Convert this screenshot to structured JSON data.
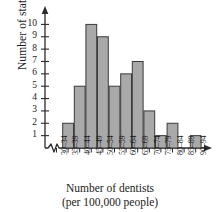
{
  "chart_data": {
    "type": "bar",
    "title": "",
    "xlabel": "Number of dentists",
    "xlabel_line2": "(per 100,000 people)",
    "ylabel": "Number of states",
    "categories": [
      "30–34",
      "35–39",
      "40–44",
      "45–49",
      "50–54",
      "55–59",
      "60–64",
      "65–69",
      "70–74",
      "75–79",
      "80–84",
      "85–89",
      "90–94"
    ],
    "values": [
      0,
      2,
      5,
      10,
      9,
      5,
      6,
      7,
      3,
      1,
      2,
      0,
      1
    ],
    "yticks": [
      1,
      2,
      3,
      4,
      5,
      6,
      7,
      8,
      9,
      10
    ],
    "ylim": [
      0,
      10.6
    ],
    "grid": false,
    "legend": null,
    "axis_break_x": true,
    "bar_fill": "#a9a9a9",
    "bar_stroke": "#3a3a3a",
    "axis_color": "#2b2b2b"
  }
}
